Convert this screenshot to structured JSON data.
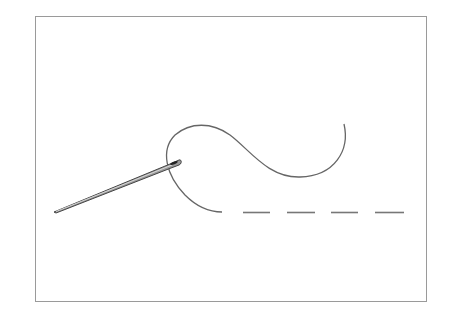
{
  "illustration": {
    "subject": "needle and thread running stitch",
    "frame_color": "#9a9a9a",
    "thread_color": "#666666",
    "needle_color": "#555555",
    "stitch_dashes": 4
  }
}
